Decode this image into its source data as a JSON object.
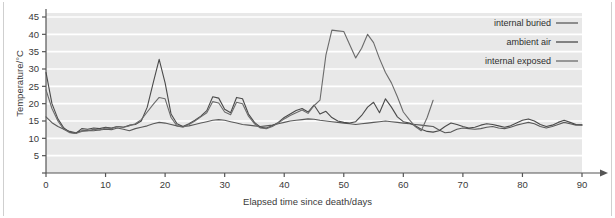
{
  "chart_data": {
    "type": "line",
    "title": "",
    "xlabel": "Elapsed time since death/days",
    "ylabel": "Temperature/°C",
    "xlim": [
      0,
      90
    ],
    "ylim": [
      0,
      47
    ],
    "xticks": [
      0,
      10,
      20,
      30,
      40,
      50,
      60,
      70,
      80,
      90
    ],
    "yticks": [
      0,
      5,
      10,
      15,
      20,
      25,
      30,
      35,
      40,
      45
    ],
    "grid": "horizontal",
    "legend_position": "top-right",
    "plot_background": "#e8e8e8",
    "gridline_color": "#ffffff",
    "axis_color": "#555555",
    "series": [
      {
        "name": "internal buried",
        "color": "#5a5a5a",
        "x": [
          0,
          1,
          2,
          3,
          4,
          5,
          6,
          7,
          8,
          9,
          10,
          11,
          12,
          13,
          14,
          15,
          16,
          17,
          18,
          19,
          20,
          21,
          22,
          23,
          24,
          25,
          26,
          27,
          28,
          29,
          30,
          31,
          32,
          33,
          34,
          35,
          36,
          37,
          38,
          39,
          40,
          41,
          42,
          43,
          44,
          45,
          46,
          47,
          48,
          49,
          50,
          51,
          52,
          53,
          54,
          55,
          56,
          57,
          58,
          59,
          60,
          61,
          62,
          63,
          64,
          65,
          66,
          67,
          68,
          69,
          70,
          71,
          72,
          73,
          74,
          75,
          76,
          77,
          78,
          79,
          80,
          81,
          82,
          83,
          84,
          85,
          86,
          87,
          88,
          89,
          90
        ],
        "values": [
          16.2,
          14.5,
          13.4,
          12.6,
          12.0,
          11.6,
          12.2,
          12.3,
          12.2,
          12.4,
          12.6,
          12.5,
          13.0,
          12.6,
          12.2,
          12.8,
          13.2,
          13.6,
          14.2,
          14.6,
          14.4,
          14.0,
          13.6,
          13.4,
          13.6,
          14.0,
          14.4,
          14.8,
          15.2,
          15.4,
          15.2,
          14.8,
          14.4,
          14.0,
          13.8,
          13.6,
          13.4,
          13.6,
          13.8,
          14.2,
          14.6,
          15.0,
          15.2,
          15.4,
          15.6,
          15.5,
          15.2,
          15.0,
          14.8,
          14.6,
          14.4,
          14.2,
          14.0,
          14.2,
          14.4,
          14.6,
          14.8,
          15.0,
          14.8,
          14.6,
          14.4,
          14.2,
          14.0,
          13.8,
          13.6,
          13.4,
          12.4,
          11.6,
          11.8,
          12.6,
          13.0,
          12.8,
          12.6,
          12.8,
          13.2,
          13.4,
          13.0,
          12.8,
          13.2,
          13.8,
          14.2,
          14.6,
          14.2,
          13.4,
          13.0,
          13.4,
          14.0,
          14.6,
          14.2,
          13.8,
          13.8
        ]
      },
      {
        "name": "ambient air",
        "color": "#4a4a4a",
        "x": [
          0,
          1,
          2,
          3,
          4,
          5,
          6,
          7,
          8,
          9,
          10,
          11,
          12,
          13,
          14,
          15,
          16,
          17,
          18,
          19,
          20,
          21,
          22,
          23,
          24,
          25,
          26,
          27,
          28,
          29,
          30,
          31,
          32,
          33,
          34,
          35,
          36,
          37,
          38,
          39,
          40,
          41,
          42,
          43,
          44,
          45,
          46,
          47,
          48,
          49,
          50,
          51,
          52,
          53,
          54,
          55,
          56,
          57,
          58,
          59,
          60,
          61,
          62,
          63,
          64,
          65,
          66,
          67,
          68,
          69,
          70,
          71,
          72,
          73,
          74,
          75,
          76,
          77,
          78,
          79,
          80,
          81,
          82,
          83,
          84,
          85,
          86,
          87,
          88,
          89,
          90
        ],
        "values": [
          29.0,
          20.0,
          15.6,
          13.0,
          11.8,
          11.4,
          12.8,
          12.6,
          13.0,
          12.8,
          13.2,
          13.0,
          13.4,
          13.2,
          13.8,
          14.0,
          15.0,
          19.0,
          26.0,
          32.8,
          26.0,
          17.0,
          14.2,
          13.4,
          14.2,
          15.2,
          16.4,
          18.0,
          22.0,
          21.6,
          18.4,
          17.4,
          21.8,
          21.4,
          17.0,
          14.6,
          13.2,
          13.0,
          13.6,
          14.6,
          16.0,
          17.0,
          18.0,
          18.6,
          17.6,
          19.6,
          17.0,
          17.8,
          16.0,
          15.0,
          14.6,
          14.4,
          14.8,
          16.6,
          19.0,
          20.4,
          17.4,
          21.4,
          19.0,
          16.2,
          14.8,
          14.4,
          13.6,
          12.6,
          12.0,
          11.8,
          12.2,
          13.4,
          14.4,
          14.0,
          13.4,
          13.0,
          13.2,
          13.8,
          14.2,
          14.0,
          13.6,
          13.2,
          13.6,
          14.4,
          15.2,
          15.6,
          15.0,
          14.0,
          13.4,
          13.8,
          14.6,
          15.2,
          14.6,
          14.0,
          13.9
        ]
      },
      {
        "name": "internal exposed",
        "color": "#6b6b6b",
        "x": [
          0,
          1,
          2,
          3,
          4,
          5,
          6,
          7,
          8,
          9,
          10,
          11,
          12,
          13,
          14,
          15,
          16,
          17,
          18,
          19,
          20,
          21,
          22,
          23,
          24,
          25,
          26,
          27,
          28,
          29,
          30,
          31,
          32,
          33,
          34,
          35,
          36,
          37,
          38,
          39,
          40,
          41,
          42,
          43,
          44,
          45,
          46,
          47,
          48,
          49,
          50,
          51,
          52,
          53,
          54,
          55,
          56,
          57,
          58,
          59,
          60,
          61,
          62,
          63,
          64,
          65
        ],
        "values": [
          24.0,
          18.6,
          15.0,
          12.6,
          11.6,
          11.4,
          12.0,
          12.2,
          12.6,
          12.4,
          13.0,
          12.8,
          13.4,
          13.2,
          13.6,
          14.2,
          15.4,
          17.6,
          19.8,
          21.8,
          21.4,
          16.0,
          13.6,
          13.2,
          14.0,
          15.0,
          16.2,
          17.4,
          20.6,
          20.2,
          17.6,
          16.8,
          20.4,
          20.0,
          16.4,
          14.2,
          13.0,
          12.8,
          13.4,
          14.4,
          15.6,
          16.6,
          17.4,
          18.2,
          17.2,
          19.4,
          21.0,
          34.0,
          41.2,
          41.0,
          40.8,
          37.0,
          33.2,
          36.0,
          40.0,
          37.6,
          33.0,
          29.0,
          26.0,
          22.0,
          17.6,
          15.4,
          13.4,
          12.2,
          16.0,
          21.0
        ]
      }
    ],
    "legend": [
      {
        "label": "internal buried",
        "color": "#5a5a5a"
      },
      {
        "label": "ambient air",
        "color": "#4a4a4a"
      },
      {
        "label": "internal exposed",
        "color": "#6b6b6b"
      }
    ]
  }
}
